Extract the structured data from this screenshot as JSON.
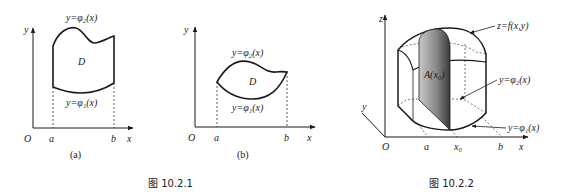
{
  "figure_10_2_1": {
    "caption": "图 10.2.1",
    "panel_a": {
      "label": "(a)",
      "axis_x": "x",
      "axis_y": "y",
      "origin": "O",
      "tick_a": "a",
      "tick_b": "b",
      "region": "D",
      "upper_curve": "y=φ₂(x)",
      "lower_curve": "y=φ₁(x)"
    },
    "panel_b": {
      "label": "(b)",
      "axis_x": "x",
      "axis_y": "y",
      "origin": "O",
      "tick_a": "a",
      "tick_b": "b",
      "region": "D",
      "upper_curve": "y=φ₂(x)",
      "lower_curve": "y=φ₁(x)"
    }
  },
  "figure_10_2_2": {
    "caption": "图 10.2.2",
    "axis_x": "x",
    "axis_y": "y",
    "axis_z": "z",
    "origin": "O",
    "tick_a": "a",
    "tick_x0": "x₀",
    "tick_b": "b",
    "surface_label": "z=f(x,y)",
    "section_label": "A(x₀)",
    "upper_curve": "y=φ₂(x)",
    "lower_curve": "y=φ₁(x)",
    "colors": {
      "line": "#1a1a1a",
      "shade_dark": "#555555",
      "shade_light": "#bdbdbd"
    }
  }
}
